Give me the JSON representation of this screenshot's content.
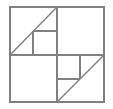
{
  "figure": {
    "canvas": {
      "width": 113,
      "height": 109,
      "background_color": "#ffffff"
    },
    "style": {
      "stroke_color": "#808080",
      "stroke_width": 1.4,
      "fill_color": "none"
    },
    "outer_square": {
      "name": "outer-square",
      "x": 10,
      "y": 7,
      "width": 94,
      "height": 95
    },
    "segments": [
      {
        "name": "midline-horizontal",
        "label": "Horizontal midline",
        "x1": 10,
        "y1": 55,
        "x2": 104,
        "y2": 55
      },
      {
        "name": "midline-vertical",
        "label": "Vertical midline",
        "x1": 57,
        "y1": 7,
        "x2": 57,
        "y2": 102
      },
      {
        "name": "diagonal-upper-left",
        "label": "Upper-left diagonal",
        "x1": 10,
        "y1": 55,
        "x2": 57,
        "y2": 7
      },
      {
        "name": "diagonal-lower-right",
        "label": "Lower-right diagonal",
        "x1": 57,
        "y1": 102,
        "x2": 104,
        "y2": 55
      },
      {
        "name": "inner-square-upper-left-left-edge",
        "label": "Small square left edge",
        "x1": 33,
        "y1": 31,
        "x2": 33,
        "y2": 55
      },
      {
        "name": "inner-square-upper-left-top-edge",
        "label": "Small square top edge",
        "x1": 33,
        "y1": 31,
        "x2": 57,
        "y2": 31
      },
      {
        "name": "inner-rect-lower-right-right-edge",
        "label": "Lower-right rectangle right edge",
        "x1": 80,
        "y1": 55,
        "x2": 80,
        "y2": 79
      },
      {
        "name": "inner-rect-lower-right-bottom-edge",
        "label": "Lower-right rectangle bottom edge",
        "x1": 57,
        "y1": 79,
        "x2": 80,
        "y2": 79
      }
    ]
  }
}
